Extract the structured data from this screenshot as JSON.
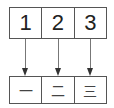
{
  "diagram": {
    "top_row": [
      {
        "label": "1"
      },
      {
        "label": "2"
      },
      {
        "label": "3"
      }
    ],
    "bottom_row": [
      {
        "label": "一"
      },
      {
        "label": "二"
      },
      {
        "label": "三"
      }
    ],
    "arrows": [
      {
        "from": "1",
        "to": "一"
      },
      {
        "from": "2",
        "to": "二"
      },
      {
        "from": "3",
        "to": "三"
      }
    ],
    "colors": {
      "border": "#555555",
      "arrow": "#333333",
      "text": "#222222"
    }
  }
}
